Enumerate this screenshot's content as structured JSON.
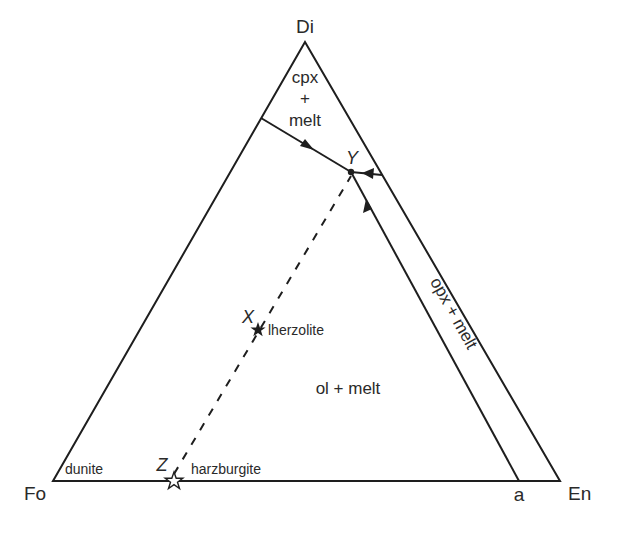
{
  "diagram": {
    "type": "ternary phase diagram",
    "vertices": {
      "top": {
        "label": "Di",
        "x": 305,
        "y": 42
      },
      "left": {
        "label": "Fo",
        "x": 53,
        "y": 481
      },
      "right": {
        "label": "En",
        "x": 560,
        "y": 481
      }
    },
    "points": {
      "Y": {
        "label": "Y",
        "x": 351,
        "y": 172
      },
      "X": {
        "label": "X",
        "x": 258,
        "y": 329,
        "rock": "lherzolite",
        "marker": "filled-star"
      },
      "Z": {
        "label": "Z",
        "x": 174,
        "y": 481,
        "rock": "harzburgite",
        "marker": "open-star"
      },
      "a": {
        "label": "a",
        "x": 519,
        "y": 481
      }
    },
    "fields": {
      "cpx": {
        "line1": "cpx",
        "line2": "+",
        "line3": "melt"
      },
      "ol": {
        "text": "ol + melt"
      },
      "opx": {
        "text": "opx + melt"
      }
    },
    "rocks": {
      "dunite": "dunite",
      "lherzolite": "lherzolite",
      "harzburgite": "harzburgite"
    },
    "colors": {
      "line": "#1e1e1e",
      "text": "#2a2a2a",
      "background": "#ffffff"
    }
  }
}
